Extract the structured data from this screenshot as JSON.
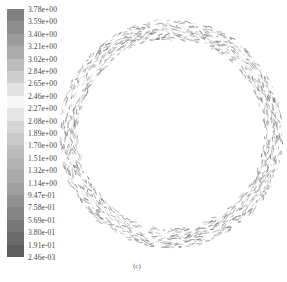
{
  "chart_data": {
    "type": "vector-field",
    "title": "",
    "caption": "(c)",
    "colorbar": {
      "labels": [
        "3.78e+00",
        "3.59e+00",
        "3.40e+00",
        "3.21e+00",
        "3.02e+00",
        "2.84e+00",
        "2.65e+00",
        "2.46e+00",
        "2.27e+00",
        "2.08e+00",
        "1.89e+00",
        "1.70e+00",
        "1.51e+00",
        "1.32e+00",
        "1.14e+00",
        "9.47e-01",
        "7.58e-01",
        "5.69e-01",
        "3.80e-01",
        "1.91e-01",
        "2.46e-03"
      ],
      "values": [
        3.78,
        3.59,
        3.4,
        3.21,
        3.02,
        2.84,
        2.65,
        2.46,
        2.27,
        2.08,
        1.89,
        1.7,
        1.51,
        1.32,
        1.14,
        0.947,
        0.758,
        0.569,
        0.38,
        0.191,
        0.00246
      ],
      "colors": [
        "#808080",
        "#8e8e8e",
        "#9c9c9c",
        "#ababab",
        "#bcbcbc",
        "#cdcdcd",
        "#e2e2e2",
        "#f7f7f7",
        "#e6e6e6",
        "#d6d6d6",
        "#c9c9c9",
        "#bdbdbd",
        "#b3b3b3",
        "#a9a9a9",
        "#9f9f9f",
        "#929292",
        "#858585",
        "#787878",
        "#6b6b6b",
        "#5e5e5e"
      ],
      "min": 0.00246,
      "max": 3.78
    },
    "annulus": {
      "center": [
        171,
        134
      ],
      "outer_radius": 112,
      "inner_radius": 93,
      "arrow_color": "#9a9a9a"
    }
  },
  "caption": "(c)"
}
